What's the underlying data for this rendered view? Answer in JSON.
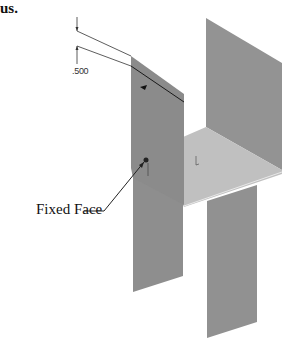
{
  "heading": "us.",
  "dimension": {
    "value": ".500"
  },
  "callout": {
    "label": "Fixed Face"
  },
  "colors": {
    "panel": "#8f8f8f",
    "floor": "#bdbdbd",
    "line": "#222222"
  }
}
